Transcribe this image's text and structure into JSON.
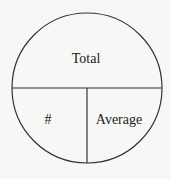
{
  "diagram": {
    "type": "split-circle",
    "sections": {
      "top": {
        "label": "Total"
      },
      "bottom_left": {
        "label": "#"
      },
      "bottom_right": {
        "label": "Average"
      }
    },
    "colors": {
      "background": "#f7f7f5",
      "stroke": "#333333",
      "text": "#222222"
    }
  }
}
